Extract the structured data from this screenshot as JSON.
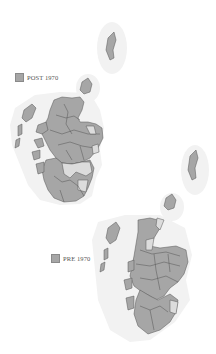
{
  "maps": [
    {
      "id": "post",
      "legend": {
        "label": "POST 1970",
        "color": "#a6a6a6"
      }
    },
    {
      "id": "pre",
      "legend": {
        "label": "PRE 1970",
        "color": "#a6a6a6"
      }
    }
  ],
  "colors": {
    "filled_region": "#a6a6a6",
    "unfilled_region": "#e2e2e2",
    "halo": "#f1f1f1",
    "border": "#5a5a5a"
  }
}
